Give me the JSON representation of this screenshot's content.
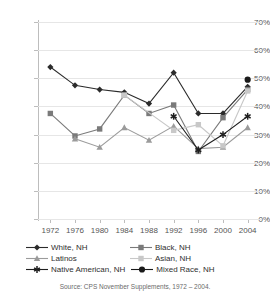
{
  "chart_data": {
    "type": "line",
    "title": "",
    "xlabel": "",
    "ylabel": "",
    "x": [
      1972,
      1976,
      1980,
      1984,
      1988,
      1992,
      1996,
      2000,
      2004
    ],
    "categories": [
      "1972",
      "1976",
      "1980",
      "1984",
      "1988",
      "1992",
      "1996",
      "2000",
      "2004"
    ],
    "ylim": [
      0,
      70
    ],
    "ytick_labels": [
      "0%",
      "10%",
      "20%",
      "30%",
      "40%",
      "50%",
      "60%",
      "70%"
    ],
    "ytick_values": [
      0,
      10,
      20,
      30,
      40,
      50,
      60,
      70
    ],
    "grid": true,
    "legend_position": "bottom",
    "series": [
      {
        "name": "White, NH",
        "marker": "diamond",
        "color": "#2b2b2b",
        "values": [
          54,
          47.5,
          46,
          45,
          41,
          52,
          37.5,
          37.5,
          47
        ]
      },
      {
        "name": "Black, NH",
        "marker": "square",
        "color": "#7a7a7a",
        "values": [
          37.5,
          29.5,
          32,
          44,
          37.5,
          40.5,
          24,
          36,
          46
        ]
      },
      {
        "name": "Latinos",
        "marker": "triangle",
        "color": "#9b9b9b",
        "values": [
          null,
          28.5,
          25.5,
          32.5,
          28,
          33,
          25,
          25.5,
          32.5
        ]
      },
      {
        "name": "Asian, NH",
        "marker": "square-light",
        "color": "#c8c8c8",
        "values": [
          null,
          null,
          null,
          44,
          null,
          31.5,
          33.5,
          26,
          45.5
        ]
      },
      {
        "name": "Native American, NH",
        "marker": "asterisk",
        "color": "#1f1f1f",
        "values": [
          null,
          null,
          null,
          null,
          null,
          36.5,
          24.5,
          30,
          36.5
        ]
      },
      {
        "name": "Mixed Race, NH",
        "marker": "circle",
        "color": "#1a1a1a",
        "values": [
          null,
          null,
          null,
          null,
          null,
          null,
          null,
          null,
          49.5
        ]
      }
    ],
    "source_note": "Source: CPS November Supplements, 1972 – 2004."
  },
  "legend": {
    "rows": [
      [
        {
          "label": "White, NH",
          "series_index": 0
        },
        {
          "label": "Black, NH",
          "series_index": 1
        }
      ],
      [
        {
          "label": "Latinos",
          "series_index": 2
        },
        {
          "label": "Asian, NH",
          "series_index": 3
        }
      ],
      [
        {
          "label": "Native American, NH",
          "series_index": 4
        },
        {
          "label": "Mixed Race, NH",
          "series_index": 5
        }
      ]
    ]
  },
  "colors": {
    "grid": "#e6e6e6",
    "axis": "#bdbdbd",
    "text": "#555555",
    "background": "#ffffff"
  }
}
